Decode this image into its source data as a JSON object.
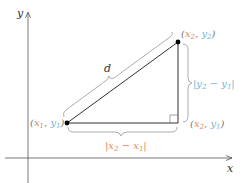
{
  "diagram": {
    "axes": {
      "x_label": "x",
      "y_label": "y"
    },
    "points": {
      "p1": {
        "label": "(x1, y1)",
        "x_part": "x",
        "x_sub": "1",
        "y_part": "y",
        "y_sub": "1"
      },
      "p2": {
        "label": "(x2, y2)",
        "x_part": "x",
        "x_sub": "2",
        "y_part": "y",
        "y_sub": "2"
      },
      "corner": {
        "label": "(x2, y1)",
        "x_part": "x",
        "x_sub": "2",
        "y_part": "y",
        "y_sub": "1"
      }
    },
    "segments": {
      "hypotenuse_label": "d",
      "horizontal_label": "|x2 − x1|",
      "vertical_label": "|y2 − y1|"
    },
    "colors": {
      "x_color": "#e0875a",
      "y_color": "#6fb7d8",
      "line": "#333333",
      "brace": "#8a8a8a",
      "axis": "#555555"
    },
    "punct": {
      "open": "(",
      "close": ")",
      "comma": ", ",
      "bar": "|",
      "minus": " − "
    }
  }
}
